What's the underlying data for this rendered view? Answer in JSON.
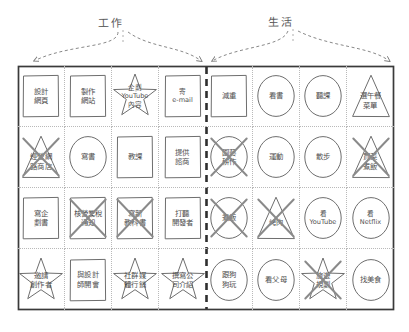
{
  "diagram": {
    "title_work": "工作",
    "title_life": "生活",
    "colors": {
      "ink": "#6e6e6e",
      "frame": "#3a3a3a",
      "strike": "#8a8a8a",
      "dotted": "#b9b9b9",
      "text": "#4f4f4f",
      "background": "#ffffff"
    },
    "columns": 8,
    "rows": 4,
    "divider_after_column": 4,
    "shapes_legend": [
      "rect",
      "circle",
      "triangle",
      "star"
    ],
    "cells": [
      {
        "label": "設計\n網頁",
        "shape": "rect",
        "struck": false,
        "group": "work"
      },
      {
        "label": "製作\n網站",
        "shape": "rect",
        "struck": false,
        "group": "work"
      },
      {
        "label": "企劃\nYouTube\n內容",
        "shape": "star",
        "struck": false,
        "group": "work"
      },
      {
        "label": "寄\ne-mail",
        "shape": "rect",
        "struck": false,
        "group": "work"
      },
      {
        "label": "減重",
        "shape": "rect",
        "struck": false,
        "group": "life"
      },
      {
        "label": "看書",
        "shape": "circle",
        "struck": false,
        "group": "life"
      },
      {
        "label": "聽課",
        "shape": "circle",
        "struck": false,
        "group": "life"
      },
      {
        "label": "選午餐\n菜單",
        "shape": "triangle",
        "struck": false,
        "group": "life"
      },
      {
        "label": "經營網\n路商店",
        "shape": "triangle",
        "struck": true,
        "group": "work"
      },
      {
        "label": "寫書",
        "shape": "circle",
        "struck": false,
        "group": "work"
      },
      {
        "label": "教課",
        "shape": "rect",
        "struck": false,
        "group": "work"
      },
      {
        "label": "提供\n諮商",
        "shape": "rect",
        "struck": false,
        "group": "work"
      },
      {
        "label": "園藝\n耕作",
        "shape": "circle",
        "struck": true,
        "group": "life"
      },
      {
        "label": "運動",
        "shape": "circle",
        "struck": false,
        "group": "life"
      },
      {
        "label": "散步",
        "shape": "circle",
        "struck": false,
        "group": "life"
      },
      {
        "label": "買菜\n煮飯",
        "shape": "triangle",
        "struck": true,
        "group": "life"
      },
      {
        "label": "寫企\n劃書",
        "shape": "rect",
        "struck": false,
        "group": "work"
      },
      {
        "label": "核營業稅\n通知",
        "shape": "rect",
        "struck": true,
        "group": "work"
      },
      {
        "label": "寫新\n教科書",
        "shape": "rect",
        "struck": true,
        "group": "work"
      },
      {
        "label": "打聽\n開發者",
        "shape": "rect",
        "struck": false,
        "group": "work"
      },
      {
        "label": "煮飯",
        "shape": "circle",
        "struck": true,
        "group": "life"
      },
      {
        "label": "烤肉",
        "shape": "triangle",
        "struck": true,
        "group": "life"
      },
      {
        "label": "看\nYouTube",
        "shape": "circle",
        "struck": false,
        "group": "life"
      },
      {
        "label": "看\nNetflix",
        "shape": "circle",
        "struck": false,
        "group": "life"
      },
      {
        "label": "邀請\n創作者",
        "shape": "star",
        "struck": false,
        "group": "work"
      },
      {
        "label": "與設計\n師開會",
        "shape": "rect",
        "struck": false,
        "group": "work"
      },
      {
        "label": "社群媒\n體行銷",
        "shape": "star",
        "struck": false,
        "group": "work"
      },
      {
        "label": "撰寫公\n司介紹",
        "shape": "star",
        "struck": false,
        "group": "work"
      },
      {
        "label": "跟狗\n狗玩",
        "shape": "circle",
        "struck": false,
        "group": "life"
      },
      {
        "label": "看父母",
        "shape": "circle",
        "struck": false,
        "group": "life"
      },
      {
        "label": "旅遊\n規劃",
        "shape": "star",
        "struck": true,
        "group": "life"
      },
      {
        "label": "找美食",
        "shape": "circle",
        "struck": false,
        "group": "life"
      }
    ]
  }
}
